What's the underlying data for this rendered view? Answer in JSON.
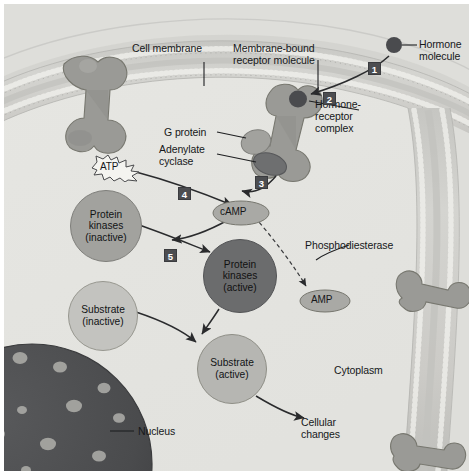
{
  "figure": {
    "background_color": "#e9e9e7",
    "cytosol_color": "#e2e2de",
    "extracellular_color": "#d6d6d2"
  },
  "labels": {
    "cell_membrane": "Cell membrane",
    "membrane_bound_receptor": "Membrane-bound\nreceptor molecule",
    "hormone_molecule": "Hormone\nmolecule",
    "hormone_receptor_complex": "Hormone-\nreceptor\ncomplex",
    "g_protein": "G protein",
    "adenylate_cyclase": "Adenylate\ncyclase",
    "phosphodiesterase": "Phosphodiesterase",
    "cytoplasm": "Cytoplasm",
    "nucleus": "Nucleus",
    "cellular_changes": "Cellular\nchanges"
  },
  "molecules": {
    "atp": "ATP",
    "camp": "cAMP",
    "amp": "AMP",
    "protein_kinases_inactive": "Protein\nkinases\n(inactive)",
    "protein_kinases_active": "Protein\nkinases\n(active)",
    "substrate_inactive": "Substrate\n(inactive)",
    "substrate_active": "Substrate\n(active)"
  },
  "steps": [
    {
      "number": "1",
      "meaning": "hormone-molecule-arrives"
    },
    {
      "number": "2",
      "meaning": "hormone-binds-receptor"
    },
    {
      "number": "3",
      "meaning": "g-protein-activates-adenylate-cyclase"
    },
    {
      "number": "4",
      "meaning": "atp-converted-to-camp"
    },
    {
      "number": "5",
      "meaning": "camp-activates-protein-kinases"
    }
  ],
  "colors": {
    "membrane_protein": "#9a9a96",
    "membrane_protein_dark": "#8a8a86",
    "hormone_dot": "#4a4b4e",
    "adenylate_cyclase": "#6e6f70",
    "kinase_inactive": "#a2a29e",
    "kinase_active": "#6b6c6d",
    "substrate_inactive": "#c3c3bf",
    "substrate_active": "#b6b6b2",
    "camp_fill": "#a9a9a5",
    "amp_fill": "#a9a9a5",
    "nucleus_fill": "#4a4b4d",
    "nucleus_pore": "#a8a8a4",
    "arrow_stroke": "#2a2b2d",
    "leader_stroke": "#1e1f21",
    "step_box": "#4c4d50",
    "step_text": "#ffffff"
  }
}
